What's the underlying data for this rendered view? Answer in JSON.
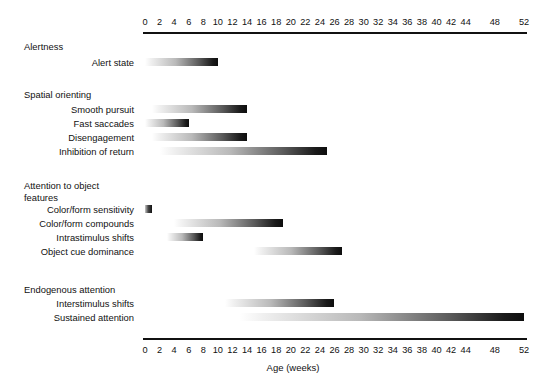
{
  "chart_data": {
    "type": "bar",
    "title": "",
    "subtitle": "",
    "xlabel": "Age (weeks)",
    "ylabel": "",
    "xlim": [
      0,
      52
    ],
    "grid": false,
    "legend": "none",
    "orientation": "horizontal",
    "note": "Horizontal gradient range bars (Gantt-style) showing the developmental window in weeks for each attention function; each bar fades in light at its onset and darkens toward its offset.",
    "xticks": [
      0,
      2,
      4,
      6,
      8,
      10,
      12,
      14,
      16,
      18,
      20,
      22,
      24,
      26,
      28,
      30,
      32,
      34,
      36,
      38,
      40,
      42,
      44,
      48,
      52
    ],
    "xtick_labels": [
      "0",
      "2",
      "4",
      "6",
      "8",
      "10",
      "12",
      "14",
      "16",
      "18",
      "20",
      "22",
      "24",
      "26",
      "28",
      "30",
      "32",
      "34",
      "36",
      "38",
      "40",
      "42",
      "44",
      "48",
      "52"
    ],
    "axes": [
      "top",
      "bottom"
    ],
    "groups": [
      {
        "name": "Alertness",
        "rows": [
          {
            "label": "Alert state",
            "start": 0,
            "end": 10
          }
        ]
      },
      {
        "name": "Spatial orienting",
        "rows": [
          {
            "label": "Smooth pursuit",
            "start": 1,
            "end": 14
          },
          {
            "label": "Fast saccades",
            "start": 0,
            "end": 6
          },
          {
            "label": "Disengagement",
            "start": 1,
            "end": 14
          },
          {
            "label": "Inhibition of return",
            "start": 2,
            "end": 25
          }
        ]
      },
      {
        "name": "Attention to object\nfeatures",
        "rows": [
          {
            "label": "Color/form sensitivity",
            "start": 0,
            "end": 1
          },
          {
            "label": "Color/form compounds",
            "start": 4,
            "end": 19
          },
          {
            "label": "Intrastimulus shifts",
            "start": 3,
            "end": 8
          },
          {
            "label": "Object cue dominance",
            "start": 15,
            "end": 27
          }
        ]
      },
      {
        "name": "Endogenous attention",
        "rows": [
          {
            "label": "Interstimulus shifts",
            "start": 11,
            "end": 26
          },
          {
            "label": "Sustained attention",
            "start": 13,
            "end": 52
          }
        ]
      }
    ]
  },
  "colors": {
    "background": "#ffffff",
    "axis": "#111111",
    "text": "#111111",
    "bar_start": "#ffffff",
    "bar_end": "#0d0d0d"
  },
  "layout": {
    "axis_left_px": 143,
    "axis_right_px": 527,
    "week0_px": 145,
    "week52_px": 524
  }
}
